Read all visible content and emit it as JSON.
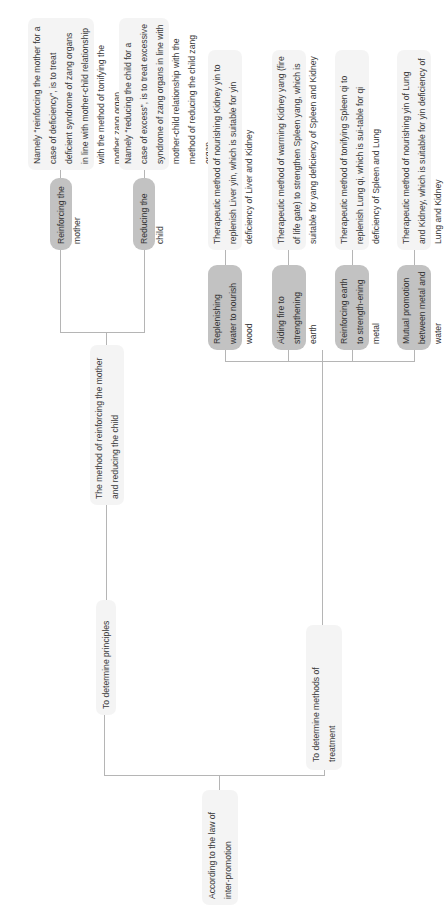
{
  "diagram": {
    "root": {
      "label": "According to the law of inter-promotion"
    },
    "principles": {
      "label": "To determine principles",
      "method": {
        "label": "The method of reinforcing the mother and reducing the child",
        "children": [
          {
            "label": "Reinforcing the mother",
            "description": "Namely “reinforcing the mother for a case of deficiency”, is to treat deficient syndrome of zang organs in line with mother-child relationship with the method of tonifying the mother zang organ"
          },
          {
            "label": "Reducing the child",
            "description": "Namely “reducing the child for a case of excess”, is to treat excessive syndrome of zang organs in line with mother-child relationship with the method of reducing the child zang organ"
          }
        ]
      }
    },
    "treatment": {
      "label": "To determine methods of treatment",
      "methods": [
        {
          "label": "Replenishing water to nourish wood",
          "description": "Therapeutic method of nourishing Kidney yin to replenish Liver yin, which is suitable for yin deficiency of Liver and Kidney"
        },
        {
          "label": "Aiding fire to strengthening earth",
          "description": "Therapeutic method of warming Kidney yang (fire of life gate) to strengthen Spleen yang, which is suitable for yang deficiency of Spleen and Kidney"
        },
        {
          "label": "Reinforcing earth to strength-ening metal",
          "description": "Therapeutic method of tonifying Spleen qi to replenish Lung qi, which is sui-table for qi deficiency of Spleen and Lung"
        },
        {
          "label": "Mutual promotion between metal and water",
          "description": "Therapeutic method of nourishing yin of Lung and Kidney, which is suitable for yin deficiency of Lung and Kidney"
        }
      ]
    },
    "colors": {
      "primary_node": "#c2c2c2",
      "secondary_node": "#f4f4f4",
      "connector": "#b5b5b5",
      "text": "#3a3a3a"
    }
  }
}
